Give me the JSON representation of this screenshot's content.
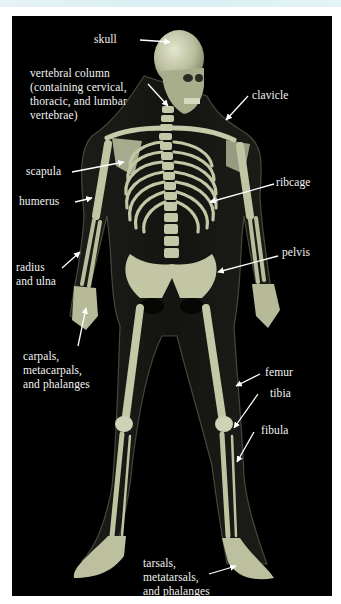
{
  "diagram": {
    "background_color": "#000000",
    "bone_color": "#c9ccb0",
    "label_color": "#f2f2f2",
    "labels": [
      {
        "id": "skull",
        "text": "skull"
      },
      {
        "id": "vertebral-column",
        "text": "vertebral column\n(containing cervical,\nthoracic, and lumbar\nvertebrae)"
      },
      {
        "id": "clavicle",
        "text": "clavicle"
      },
      {
        "id": "scapula",
        "text": "scapula"
      },
      {
        "id": "ribcage",
        "text": "ribcage"
      },
      {
        "id": "humerus",
        "text": "humerus"
      },
      {
        "id": "pelvis",
        "text": "pelvis"
      },
      {
        "id": "radius-ulna",
        "text": "radius\nand ulna"
      },
      {
        "id": "carpals",
        "text": "carpals,\nmetacarpals,\nand phalanges"
      },
      {
        "id": "femur",
        "text": "femur"
      },
      {
        "id": "tibia",
        "text": "tibia"
      },
      {
        "id": "fibula",
        "text": "fibula"
      },
      {
        "id": "tarsals",
        "text": "tarsals,\nmetatarsals,\nand phalanges"
      }
    ]
  }
}
